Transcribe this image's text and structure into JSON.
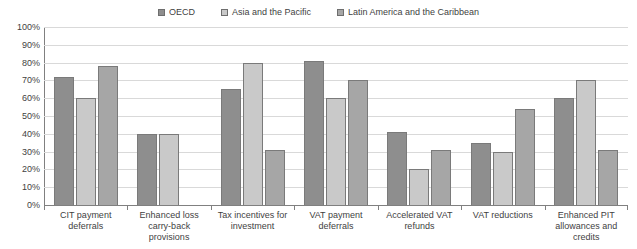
{
  "chart_data": {
    "type": "bar",
    "title": "",
    "subtitle": "",
    "xlabel": "",
    "ylabel": "",
    "ylim": [
      0,
      100
    ],
    "ytick_labels": [
      "100%",
      "90%",
      "80%",
      "70%",
      "60%",
      "50%",
      "40%",
      "30%",
      "20%",
      "10%",
      "0%"
    ],
    "ytick_values": [
      100,
      90,
      80,
      70,
      60,
      50,
      40,
      30,
      20,
      10,
      0
    ],
    "grid": true,
    "legend_position": "top-center",
    "value_suffix": "%",
    "categories": [
      "CIT payment deferrals",
      "Enhanced loss carry-back provisions",
      "Tax incentives for investment",
      "VAT payment deferrals",
      "Accelerated VAT refunds",
      "VAT reductions",
      "Enhanced PIT allowances and credits"
    ],
    "series": [
      {
        "name": "OECD",
        "color": "#8e8e8e",
        "values": [
          72,
          40,
          65,
          81,
          41,
          35,
          60
        ]
      },
      {
        "name": "Asia and the Pacific",
        "color": "#c9c9c9",
        "values": [
          60,
          40,
          80,
          60,
          20,
          30,
          70
        ]
      },
      {
        "name": "Latin America and the Caribbean",
        "color": "#a6a6a6",
        "values": [
          78,
          null,
          31,
          70,
          31,
          54,
          31
        ]
      }
    ]
  }
}
